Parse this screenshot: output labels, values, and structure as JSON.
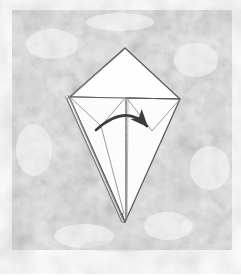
{
  "figure": {
    "title": "Origami fold step diagram",
    "canvas": {
      "width": 241,
      "height": 276
    },
    "colors": {
      "page_background": "#ffffff",
      "texture_background_light": "#f4f4f4",
      "texture_background_mid": "#e9e9e9",
      "texture_background_dark": "#dddddd",
      "paper_fill": "#fefefe",
      "paper_fill_shadow": "#f2f2f2",
      "outline_stroke": "#59595c",
      "crease_stroke": "#8a8a8d",
      "dashed_stroke": "#b0b0b3",
      "arrow_stroke": "#3c3c3f"
    },
    "background_panel": {
      "x": 12,
      "y": 10,
      "width": 220,
      "height": 240,
      "description": "mottled grey textured rectangle"
    },
    "model": {
      "description": "Paper model shaped like an elongated kite / diamond with a broad upper triangle, a wide horizontal crease across the middle and a long narrow point descending to the bottom.",
      "key_points": {
        "top_apex": {
          "x": 125,
          "y": 48
        },
        "left_corner": {
          "x": 70,
          "y": 97
        },
        "right_corner": {
          "x": 180,
          "y": 99
        },
        "bottom_tip": {
          "x": 125,
          "y": 222
        },
        "inner_fold_vertex": {
          "x": 101,
          "y": 126
        },
        "center_crease_top": {
          "x": 126,
          "y": 97
        },
        "center_crease_bottom": {
          "x": 126,
          "y": 220
        }
      }
    },
    "strokes": {
      "outline_width": 1.25,
      "crease_width": 0.85,
      "dashed_width": 0.9,
      "dash_pattern": "4 4",
      "arrow_width": 2.6
    },
    "annotations": {
      "arrow": {
        "type": "curved-fold-arrow",
        "label": "fold-flap-to-the-right",
        "start": {
          "x": 96,
          "y": 130
        },
        "control": {
          "x": 126,
          "y": 103
        },
        "end": {
          "x": 147,
          "y": 126
        },
        "arrowhead_at": "end",
        "direction": "left-to-right"
      },
      "dashed_line": {
        "type": "valley-fold-line",
        "label": "vertical-center-dashed-crease",
        "x": 126,
        "y_start": 97,
        "y_end": 140
      }
    }
  }
}
